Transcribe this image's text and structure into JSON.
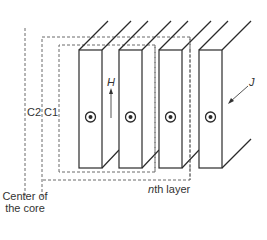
{
  "figure": {
    "labels": {
      "h_field": "H",
      "current_density": "J",
      "contour_c2": "C2",
      "contour_c1": "C1",
      "nth_layer_italic": "n",
      "nth_layer_rest": "th layer",
      "core_center_line1": "Center of",
      "core_center_line2": "the core"
    },
    "layers": [
      {
        "index": 1,
        "symbol": "current-out-of-page"
      },
      {
        "index": 2,
        "symbol": "current-out-of-page"
      },
      {
        "index": 3,
        "symbol": "current-out-of-page"
      },
      {
        "index": 4,
        "symbol": "current-out-of-page"
      }
    ],
    "colors": {
      "stroke": "#2a2a2a",
      "dashed": "#6a6a6a",
      "text": "#333333",
      "background": "#ffffff"
    }
  }
}
